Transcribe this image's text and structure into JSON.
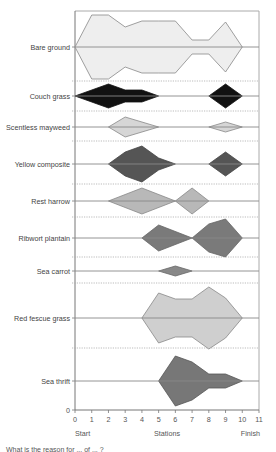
{
  "chart_data": {
    "type": "kite",
    "title": "",
    "xlabel": "Stations",
    "x_start_label": "Start",
    "x_end_label": "Finish",
    "x_ticks": [
      0,
      1,
      2,
      3,
      4,
      5,
      6,
      7,
      8,
      9,
      10,
      11
    ],
    "xlim": [
      0,
      11
    ],
    "y_zero_label": "0",
    "unit": "percentage cover (kite half-width, relative)",
    "species": [
      {
        "name": "Bare ground",
        "color": "#eeeeee",
        "stroke": "#888888",
        "points": [
          [
            0,
            0
          ],
          [
            1,
            32
          ],
          [
            2,
            32
          ],
          [
            3,
            20
          ],
          [
            4,
            26
          ],
          [
            5,
            26
          ],
          [
            6,
            26
          ],
          [
            7,
            7
          ],
          [
            8,
            7
          ],
          [
            9,
            25
          ],
          [
            10,
            0
          ]
        ]
      },
      {
        "name": "Couch grass",
        "color": "#111111",
        "stroke": "#111111",
        "points": [
          [
            0,
            0
          ],
          [
            2,
            12
          ],
          [
            3,
            6
          ],
          [
            4,
            6
          ],
          [
            5,
            0
          ]
        ],
        "points2": [
          [
            8,
            0
          ],
          [
            9,
            12
          ],
          [
            10,
            0
          ]
        ]
      },
      {
        "name": "Scentless mayweed",
        "color": "#d6d6d6",
        "stroke": "#888888",
        "points": [
          [
            2,
            0
          ],
          [
            3,
            10
          ],
          [
            5,
            0
          ]
        ],
        "points2": [
          [
            8,
            0
          ],
          [
            9,
            5
          ],
          [
            10,
            0
          ]
        ]
      },
      {
        "name": "Yellow composite",
        "color": "#555555",
        "stroke": "#444444",
        "points": [
          [
            2,
            0
          ],
          [
            3,
            12
          ],
          [
            4,
            18
          ],
          [
            5,
            6
          ],
          [
            6,
            0
          ]
        ],
        "points2": [
          [
            8,
            0
          ],
          [
            9,
            12
          ],
          [
            10,
            0
          ]
        ]
      },
      {
        "name": "Rest harrow",
        "color": "#b8b8b8",
        "stroke": "#888888",
        "points": [
          [
            2,
            0
          ],
          [
            4,
            13
          ],
          [
            6,
            0
          ],
          [
            7,
            13
          ],
          [
            8,
            0
          ]
        ]
      },
      {
        "name": "Ribwort plantain",
        "color": "#7a7a7a",
        "stroke": "#666666",
        "points": [
          [
            4,
            0
          ],
          [
            5,
            13
          ],
          [
            7,
            0
          ],
          [
            8,
            14
          ],
          [
            9,
            19
          ],
          [
            10,
            0
          ]
        ]
      },
      {
        "name": "Sea carrot",
        "color": "#888888",
        "stroke": "#666666",
        "points": [
          [
            5,
            0
          ],
          [
            6,
            5
          ],
          [
            7,
            0
          ]
        ]
      },
      {
        "name": "Red fescue grass",
        "color": "#cfcfcf",
        "stroke": "#888888",
        "points": [
          [
            4,
            0
          ],
          [
            5,
            25
          ],
          [
            6,
            19
          ],
          [
            7,
            19
          ],
          [
            8,
            31
          ],
          [
            9,
            20
          ],
          [
            10,
            0
          ]
        ]
      },
      {
        "name": "Sea thrift",
        "color": "#777777",
        "stroke": "#555555",
        "points": [
          [
            5,
            0
          ],
          [
            6,
            25
          ],
          [
            7,
            19
          ],
          [
            8,
            7
          ],
          [
            9,
            7
          ],
          [
            10,
            0
          ]
        ]
      }
    ]
  },
  "caption": "What is the reason for ... of ... ?"
}
